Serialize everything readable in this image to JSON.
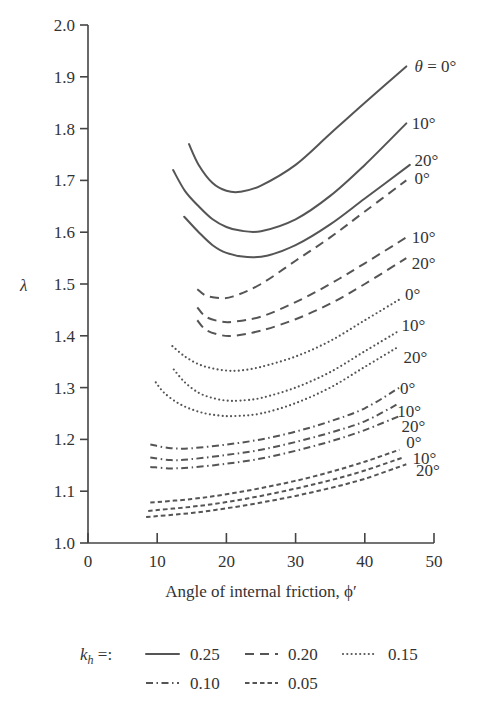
{
  "chart_data": {
    "type": "line",
    "title": "",
    "xlabel": "Angle of internal friction, ϕ′",
    "ylabel": "λ",
    "xlim": [
      0,
      50
    ],
    "ylim": [
      1.0,
      2.0
    ],
    "xticks": [
      0,
      10,
      20,
      30,
      40,
      50
    ],
    "yticks": [
      1.0,
      1.1,
      1.2,
      1.3,
      1.4,
      1.5,
      1.6,
      1.7,
      1.8,
      1.9,
      2.0
    ],
    "xtick_labels": [
      "0",
      "10",
      "20",
      "30",
      "40",
      "50"
    ],
    "ytick_labels": [
      "1.0",
      "1.1",
      "1.2",
      "1.3",
      "1.4",
      "1.5",
      "1.6",
      "1.7",
      "1.8",
      "1.9",
      "2.0"
    ],
    "grid": false,
    "legend_position": "bottom",
    "legend_prefix": "k_h =:",
    "legend": [
      {
        "label": "0.25",
        "style": "solid"
      },
      {
        "label": "0.20",
        "style": "dashed"
      },
      {
        "label": "0.15",
        "style": "dotted"
      },
      {
        "label": "0.10",
        "style": "dashdot"
      },
      {
        "label": "0.05",
        "style": "shortdash"
      }
    ],
    "series": [
      {
        "name": "kh=0.25, theta=0",
        "kh": 0.25,
        "theta": 0,
        "style": "solid",
        "label": "θ = 0°",
        "x": [
          14.6,
          16,
          18,
          20,
          22,
          25,
          30,
          35,
          40,
          46
        ],
        "y": [
          1.77,
          1.73,
          1.695,
          1.68,
          1.678,
          1.69,
          1.73,
          1.79,
          1.85,
          1.92
        ]
      },
      {
        "name": "kh=0.25, theta=10",
        "kh": 0.25,
        "theta": 10,
        "style": "solid",
        "label": "10°",
        "x": [
          12.3,
          14,
          16,
          18,
          20,
          22,
          25,
          30,
          35,
          40,
          46
        ],
        "y": [
          1.72,
          1.68,
          1.65,
          1.625,
          1.61,
          1.603,
          1.602,
          1.625,
          1.67,
          1.73,
          1.81
        ]
      },
      {
        "name": "kh=0.25, theta=20",
        "kh": 0.25,
        "theta": 20,
        "style": "solid",
        "label": "20°",
        "x": [
          13.9,
          16,
          18,
          20,
          23,
          26,
          30,
          35,
          40,
          46.5
        ],
        "y": [
          1.63,
          1.6,
          1.575,
          1.56,
          1.552,
          1.555,
          1.575,
          1.615,
          1.665,
          1.73
        ]
      },
      {
        "name": "kh=0.20, theta=0",
        "kh": 0.2,
        "theta": 0,
        "style": "dashed",
        "label": "0°",
        "x": [
          15.8,
          17,
          19,
          21,
          25,
          30,
          35,
          40,
          46
        ],
        "y": [
          1.49,
          1.478,
          1.473,
          1.476,
          1.5,
          1.545,
          1.59,
          1.64,
          1.7
        ]
      },
      {
        "name": "kh=0.20, theta=10",
        "kh": 0.2,
        "theta": 10,
        "style": "dashed",
        "label": "10°",
        "x": [
          15.8,
          17,
          19,
          21,
          25,
          30,
          35,
          40,
          46
        ],
        "y": [
          1.455,
          1.437,
          1.428,
          1.427,
          1.437,
          1.465,
          1.5,
          1.54,
          1.59
        ]
      },
      {
        "name": "kh=0.20, theta=20",
        "kh": 0.2,
        "theta": 20,
        "style": "dashed",
        "label": "20°",
        "x": [
          15.8,
          17,
          19,
          21,
          25,
          30,
          35,
          40,
          46
        ],
        "y": [
          1.43,
          1.412,
          1.402,
          1.4,
          1.41,
          1.432,
          1.462,
          1.5,
          1.55
        ]
      },
      {
        "name": "kh=0.15, theta=0",
        "kh": 0.15,
        "theta": 0,
        "style": "dotted",
        "label": "0°",
        "x": [
          12.2,
          14,
          16,
          18,
          20,
          22,
          25,
          30,
          35,
          40,
          45
        ],
        "y": [
          1.38,
          1.36,
          1.345,
          1.337,
          1.333,
          1.333,
          1.34,
          1.36,
          1.39,
          1.43,
          1.47
        ]
      },
      {
        "name": "kh=0.15, theta=10",
        "kh": 0.15,
        "theta": 10,
        "style": "dotted",
        "label": "10°",
        "x": [
          12.4,
          14,
          16,
          18,
          20,
          22,
          25,
          30,
          35,
          40,
          45
        ],
        "y": [
          1.335,
          1.31,
          1.29,
          1.28,
          1.275,
          1.275,
          1.28,
          1.3,
          1.33,
          1.37,
          1.41
        ]
      },
      {
        "name": "kh=0.15, theta=20",
        "kh": 0.15,
        "theta": 20,
        "style": "dotted",
        "label": "20°",
        "x": [
          9.8,
          11,
          13,
          15,
          17,
          19,
          21,
          25,
          30,
          35,
          40,
          45
        ],
        "y": [
          1.31,
          1.29,
          1.27,
          1.258,
          1.25,
          1.246,
          1.245,
          1.25,
          1.27,
          1.3,
          1.34,
          1.38
        ]
      },
      {
        "name": "kh=0.10, theta=0",
        "kh": 0.1,
        "theta": 0,
        "style": "dashdot",
        "label": "0°",
        "x": [
          9,
          12,
          15,
          20,
          25,
          30,
          35,
          40,
          45
        ],
        "y": [
          1.19,
          1.183,
          1.183,
          1.19,
          1.2,
          1.215,
          1.235,
          1.26,
          1.3
        ]
      },
      {
        "name": "kh=0.10, theta=10",
        "kh": 0.1,
        "theta": 10,
        "style": "dashdot",
        "label": "10°",
        "x": [
          9,
          12,
          15,
          20,
          25,
          30,
          35,
          40,
          45
        ],
        "y": [
          1.165,
          1.16,
          1.162,
          1.17,
          1.18,
          1.195,
          1.213,
          1.235,
          1.27
        ]
      },
      {
        "name": "kh=0.10, theta=20",
        "kh": 0.1,
        "theta": 20,
        "style": "dashdot",
        "label": "20°",
        "x": [
          9,
          12,
          15,
          20,
          25,
          30,
          35,
          40,
          45
        ],
        "y": [
          1.147,
          1.144,
          1.146,
          1.153,
          1.163,
          1.178,
          1.196,
          1.218,
          1.245
        ]
      },
      {
        "name": "kh=0.05, theta=0",
        "kh": 0.05,
        "theta": 0,
        "style": "shortdash",
        "label": "0°",
        "x": [
          9,
          15,
          20,
          25,
          30,
          35,
          40,
          45
        ],
        "y": [
          1.078,
          1.085,
          1.094,
          1.106,
          1.12,
          1.137,
          1.157,
          1.18
        ]
      },
      {
        "name": "kh=0.05, theta=10",
        "kh": 0.05,
        "theta": 10,
        "style": "shortdash",
        "label": "10°",
        "x": [
          8.7,
          15,
          20,
          25,
          30,
          35,
          40,
          45.5
        ],
        "y": [
          1.062,
          1.07,
          1.079,
          1.091,
          1.105,
          1.121,
          1.14,
          1.165
        ]
      },
      {
        "name": "kh=0.05, theta=20",
        "kh": 0.05,
        "theta": 20,
        "style": "shortdash",
        "label": "20°",
        "x": [
          8.4,
          15,
          20,
          25,
          30,
          35,
          40,
          46
        ],
        "y": [
          1.05,
          1.058,
          1.067,
          1.078,
          1.091,
          1.106,
          1.124,
          1.152
        ]
      }
    ],
    "curve_labels": [
      {
        "text": "θ = 0°",
        "x": 47.2,
        "y": 1.92
      },
      {
        "text": "10°",
        "x": 46.8,
        "y": 1.81
      },
      {
        "text": "20°",
        "x": 47.2,
        "y": 1.74
      },
      {
        "text": "0°",
        "x": 47.2,
        "y": 1.705
      },
      {
        "text": "10°",
        "x": 46.8,
        "y": 1.59
      },
      {
        "text": "20°",
        "x": 46.8,
        "y": 1.54
      },
      {
        "text": "0°",
        "x": 45.8,
        "y": 1.48
      },
      {
        "text": "10°",
        "x": 45.3,
        "y": 1.42
      },
      {
        "text": "20°",
        "x": 45.6,
        "y": 1.36
      },
      {
        "text": "0°",
        "x": 45.1,
        "y": 1.3
      },
      {
        "text": "10°",
        "x": 44.7,
        "y": 1.255
      },
      {
        "text": "20°",
        "x": 45.3,
        "y": 1.225
      },
      {
        "text": "0°",
        "x": 46.0,
        "y": 1.195
      },
      {
        "text": "10°",
        "x": 46.9,
        "y": 1.165
      },
      {
        "text": "20°",
        "x": 47.4,
        "y": 1.14
      }
    ]
  }
}
